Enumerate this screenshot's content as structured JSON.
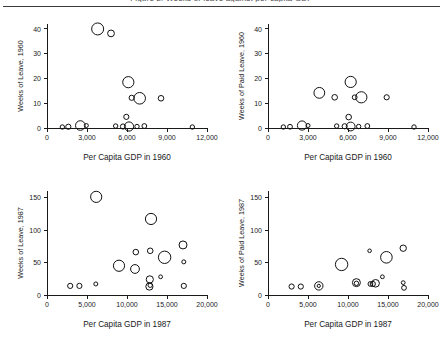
{
  "figure": {
    "clipped_caption": "Figure 2. Weeks of leave against per capita GDP",
    "background_color": "#ffffff",
    "marker_color": "#111111",
    "axis_color": "#1a1a1a"
  },
  "chart_data": [
    {
      "id": "top-left",
      "type": "scatter",
      "title": "",
      "xlabel": "Per Capita GDP in 1960",
      "ylabel": "Weeks of Leave, 1960",
      "xlim": [
        0,
        12000
      ],
      "ylim": [
        0,
        42
      ],
      "xticks": [
        0,
        3000,
        6000,
        9000,
        12000
      ],
      "xticklabels": [
        "0",
        "3,000",
        "6,000",
        "9,000",
        "12,000"
      ],
      "yticks": [
        0,
        10,
        20,
        30,
        40
      ],
      "yticklabels": [
        "0",
        "10",
        "20",
        "30",
        "40"
      ],
      "grid": false,
      "legend": "none",
      "marker": "open-circle",
      "points": [
        {
          "x": 3800,
          "y": 40.0,
          "r": 6.0
        },
        {
          "x": 4800,
          "y": 38.2,
          "r": 3.4
        },
        {
          "x": 6100,
          "y": 18.5,
          "r": 5.6
        },
        {
          "x": 6950,
          "y": 12.0,
          "r": 5.8
        },
        {
          "x": 6350,
          "y": 12.2,
          "r": 2.6
        },
        {
          "x": 8550,
          "y": 12.0,
          "r": 2.8
        },
        {
          "x": 5950,
          "y": 4.5,
          "r": 2.6
        },
        {
          "x": 1150,
          "y": 0.4,
          "r": 2.2
        },
        {
          "x": 1600,
          "y": 0.5,
          "r": 2.6
        },
        {
          "x": 2500,
          "y": 1.0,
          "r": 4.8
        },
        {
          "x": 2950,
          "y": 1.0,
          "r": 2.0
        },
        {
          "x": 5150,
          "y": 0.8,
          "r": 2.2
        },
        {
          "x": 5700,
          "y": 0.6,
          "r": 2.6
        },
        {
          "x": 6150,
          "y": 0.6,
          "r": 4.6
        },
        {
          "x": 6750,
          "y": 0.6,
          "r": 2.2
        },
        {
          "x": 7300,
          "y": 0.8,
          "r": 2.4
        },
        {
          "x": 10900,
          "y": 0.4,
          "r": 2.2
        }
      ]
    },
    {
      "id": "top-right",
      "type": "scatter",
      "title": "",
      "xlabel": "Per Capita GDP in 1960",
      "ylabel": "Weeks of Paid Leave, 1960",
      "xlim": [
        0,
        12000
      ],
      "ylim": [
        0,
        42
      ],
      "xticks": [
        0,
        3000,
        6000,
        9000,
        12000
      ],
      "xticklabels": [
        "0",
        "3,000",
        "6,000",
        "9,000",
        "12,000"
      ],
      "yticks": [
        0,
        10,
        20,
        30,
        40
      ],
      "yticklabels": [
        "0",
        "10",
        "20",
        "30",
        "40"
      ],
      "grid": false,
      "legend": "none",
      "marker": "open-circle",
      "points": [
        {
          "x": 6200,
          "y": 18.6,
          "r": 5.6
        },
        {
          "x": 3850,
          "y": 14.2,
          "r": 5.4
        },
        {
          "x": 7000,
          "y": 12.4,
          "r": 5.6
        },
        {
          "x": 6500,
          "y": 12.4,
          "r": 2.4
        },
        {
          "x": 5000,
          "y": 12.4,
          "r": 2.8
        },
        {
          "x": 8900,
          "y": 12.4,
          "r": 2.6
        },
        {
          "x": 6050,
          "y": 4.4,
          "r": 2.8
        },
        {
          "x": 1150,
          "y": 0.4,
          "r": 2.2
        },
        {
          "x": 1650,
          "y": 0.5,
          "r": 2.4
        },
        {
          "x": 2550,
          "y": 1.0,
          "r": 4.6
        },
        {
          "x": 3000,
          "y": 1.0,
          "r": 2.0
        },
        {
          "x": 5150,
          "y": 0.8,
          "r": 2.2
        },
        {
          "x": 5750,
          "y": 0.7,
          "r": 2.6
        },
        {
          "x": 6200,
          "y": 0.6,
          "r": 4.4
        },
        {
          "x": 6800,
          "y": 0.6,
          "r": 2.2
        },
        {
          "x": 7450,
          "y": 0.8,
          "r": 2.4
        },
        {
          "x": 10950,
          "y": 0.4,
          "r": 2.2
        }
      ]
    },
    {
      "id": "bottom-left",
      "type": "scatter",
      "title": "",
      "xlabel": "Per Capita GDP in 1987",
      "ylabel": "Weeks of Leave, 1987",
      "xlim": [
        0,
        20000
      ],
      "ylim": [
        0,
        160
      ],
      "xticks": [
        0,
        5000,
        10000,
        15000,
        20000
      ],
      "xticklabels": [
        "0",
        "5,000",
        "10,000",
        "15,000",
        "20,000"
      ],
      "yticks": [
        0,
        50,
        100,
        150
      ],
      "yticklabels": [
        "0",
        "50",
        "100",
        "150"
      ],
      "grid": false,
      "legend": "none",
      "marker": "open-circle",
      "points": [
        {
          "x": 6150,
          "y": 151,
          "r": 5.6
        },
        {
          "x": 13000,
          "y": 117,
          "r": 5.6
        },
        {
          "x": 17000,
          "y": 77,
          "r": 4.0
        },
        {
          "x": 11100,
          "y": 66,
          "r": 2.8
        },
        {
          "x": 12900,
          "y": 68,
          "r": 2.8
        },
        {
          "x": 14700,
          "y": 58,
          "r": 6.2
        },
        {
          "x": 17100,
          "y": 51,
          "r": 2.0
        },
        {
          "x": 9000,
          "y": 45,
          "r": 5.6
        },
        {
          "x": 11000,
          "y": 40,
          "r": 4.4
        },
        {
          "x": 14200,
          "y": 28,
          "r": 1.9
        },
        {
          "x": 12850,
          "y": 24,
          "r": 3.6
        },
        {
          "x": 12800,
          "y": 13,
          "r": 3.6
        },
        {
          "x": 12900,
          "y": 15,
          "r": 2.2
        },
        {
          "x": 2900,
          "y": 14,
          "r": 2.6
        },
        {
          "x": 4050,
          "y": 14,
          "r": 2.6
        },
        {
          "x": 6100,
          "y": 17,
          "r": 2.0
        },
        {
          "x": 17100,
          "y": 14,
          "r": 2.6
        }
      ]
    },
    {
      "id": "bottom-right",
      "type": "scatter",
      "title": "",
      "xlabel": "Per Capita GDP in 1987",
      "ylabel": "Weeks of Paid Leave, 1987",
      "xlim": [
        0,
        20000
      ],
      "ylim": [
        0,
        160
      ],
      "xticks": [
        0,
        5000,
        10000,
        15000,
        20000
      ],
      "xticklabels": [
        "0",
        "5,000",
        "10,000",
        "15,000",
        "20,000"
      ],
      "yticks": [
        0,
        50,
        100,
        150
      ],
      "yticklabels": [
        "0",
        "50",
        "100",
        "150"
      ],
      "grid": false,
      "legend": "none",
      "marker": "open-circle",
      "points": [
        {
          "x": 16900,
          "y": 72,
          "r": 3.2
        },
        {
          "x": 12700,
          "y": 68,
          "r": 1.8
        },
        {
          "x": 14800,
          "y": 58,
          "r": 5.8
        },
        {
          "x": 9200,
          "y": 47,
          "r": 6.2
        },
        {
          "x": 14300,
          "y": 28,
          "r": 1.9
        },
        {
          "x": 11050,
          "y": 19,
          "r": 4.0
        },
        {
          "x": 11050,
          "y": 18,
          "r": 2.2
        },
        {
          "x": 12800,
          "y": 17,
          "r": 2.4
        },
        {
          "x": 13100,
          "y": 17,
          "r": 2.6
        },
        {
          "x": 13450,
          "y": 18,
          "r": 3.8
        },
        {
          "x": 16900,
          "y": 19,
          "r": 1.9
        },
        {
          "x": 17000,
          "y": 11,
          "r": 2.4
        },
        {
          "x": 2950,
          "y": 13,
          "r": 2.6
        },
        {
          "x": 4100,
          "y": 13,
          "r": 2.6
        },
        {
          "x": 6350,
          "y": 14,
          "r": 4.2
        },
        {
          "x": 6350,
          "y": 14,
          "r": 1.6
        }
      ]
    }
  ]
}
